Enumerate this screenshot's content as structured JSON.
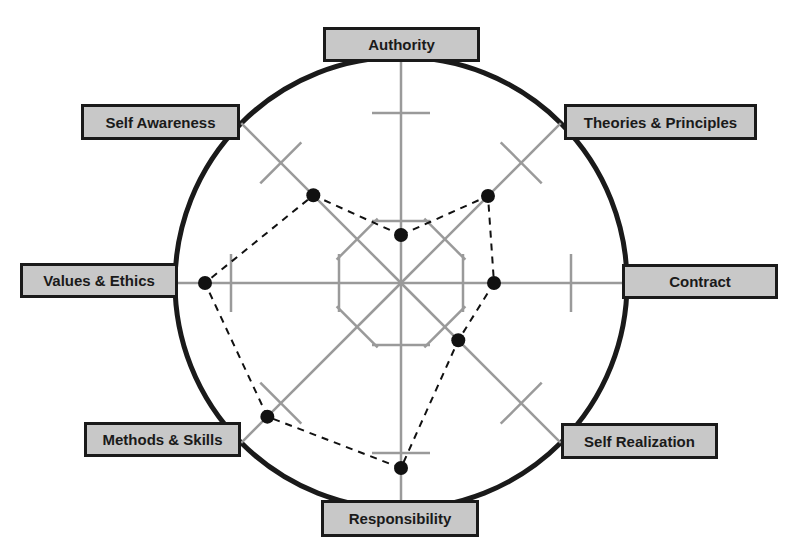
{
  "diagram": {
    "title": "",
    "type": "radar / spider diagram",
    "center": [
      401,
      283
    ],
    "circle_radius": 226,
    "colors": {
      "circle": "#1a1a1a",
      "axis": "#9a9a9a",
      "label_fill": "#c8c8c8",
      "label_border": "#1a1a1a",
      "point": "#111111",
      "polygon": "#111111"
    },
    "tick_radii": [
      62,
      170
    ],
    "axes": [
      {
        "id": "authority",
        "label": "Authority",
        "angle": -90,
        "value_radius": 48,
        "box": {
          "x": 323,
          "y": 27,
          "w": 157,
          "h": 35
        }
      },
      {
        "id": "theories",
        "label": "Theories & Principles",
        "angle": -45,
        "value_radius": 123,
        "box": {
          "x": 564,
          "y": 104,
          "w": 193,
          "h": 36
        }
      },
      {
        "id": "contract",
        "label": "Contract",
        "angle": 0,
        "value_radius": 93,
        "box": {
          "x": 622,
          "y": 264,
          "w": 156,
          "h": 35
        }
      },
      {
        "id": "self-realization",
        "label": "Self Realization",
        "angle": 45,
        "value_radius": 81,
        "box": {
          "x": 561,
          "y": 423,
          "w": 157,
          "h": 36
        }
      },
      {
        "id": "responsibility",
        "label": "Responsibility",
        "angle": 90,
        "value_radius": 185,
        "box": {
          "x": 321,
          "y": 500,
          "w": 158,
          "h": 37
        }
      },
      {
        "id": "methods",
        "label": "Methods & Skills",
        "angle": 135,
        "value_radius": 189,
        "box": {
          "x": 84,
          "y": 422,
          "w": 157,
          "h": 35
        }
      },
      {
        "id": "values",
        "label": "Values & Ethics",
        "angle": 180,
        "value_radius": 196,
        "box": {
          "x": 20,
          "y": 263,
          "w": 158,
          "h": 35
        }
      },
      {
        "id": "self-awareness",
        "label": "Self Awareness",
        "angle": -135,
        "value_radius": 124,
        "box": {
          "x": 81,
          "y": 104,
          "w": 159,
          "h": 36
        }
      }
    ]
  },
  "labels": {
    "authority": "Authority",
    "theories": "Theories & Principles",
    "contract": "Contract",
    "self_realization": "Self Realization",
    "responsibility": "Responsibility",
    "methods": "Methods & Skills",
    "values": "Values & Ethics",
    "self_awareness": "Self Awareness"
  }
}
